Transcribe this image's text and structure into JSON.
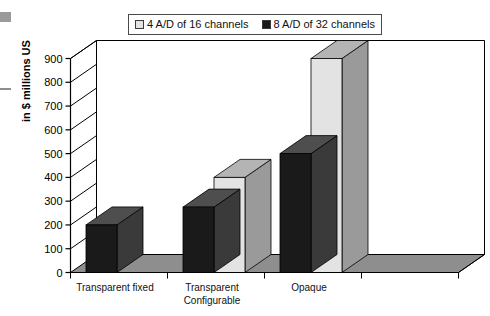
{
  "legend": {
    "entries": [
      {
        "label": "4 A/D of 16 channels",
        "swatch": "light",
        "color": "#e3e3e3"
      },
      {
        "label": "8 A/D of 32 channels",
        "swatch": "dark",
        "color": "#1a1a1a"
      }
    ]
  },
  "axis": {
    "y_title": "in $ millions US",
    "ticks": [
      "900",
      "800",
      "700",
      "600",
      "500",
      "400",
      "300",
      "200",
      "100",
      "0"
    ]
  },
  "categories": [
    {
      "line1": "Transparent fixed",
      "line2": ""
    },
    {
      "line1": "Transparent",
      "line2": "Configurable"
    },
    {
      "line1": "Opaque",
      "line2": ""
    },
    {
      "line1": "",
      "line2": ""
    }
  ],
  "chart_data": {
    "type": "bar",
    "title": "",
    "subtitle": "",
    "xlabel": "",
    "ylabel": "in $ millions US",
    "ylim": [
      0,
      900
    ],
    "ytick_step": 100,
    "grid": true,
    "legend_position": "top",
    "three_d": true,
    "categories": [
      "Transparent fixed",
      "Transparent Configurable",
      "Opaque",
      ""
    ],
    "series": [
      {
        "name": "4 A/D of 16 channels",
        "color": "#e3e3e3",
        "values": [
          0,
          400,
          900,
          0
        ]
      },
      {
        "name": "8 A/D of 32 channels",
        "color": "#1a1a1a",
        "values": [
          200,
          275,
          500,
          0
        ]
      }
    ],
    "annotations": []
  },
  "colors": {
    "bar_light_front": "#e3e3e3",
    "bar_light_top": "#b4b4b4",
    "bar_light_side": "#9a9a9a",
    "bar_dark_front": "#1a1a1a",
    "bar_dark_top": "#4e4e4e",
    "bar_dark_side": "#3a3a3a",
    "floor": "#8e8e8e",
    "wall": "#ffffff",
    "axis_line": "#000000",
    "grid_line": "#000000"
  }
}
